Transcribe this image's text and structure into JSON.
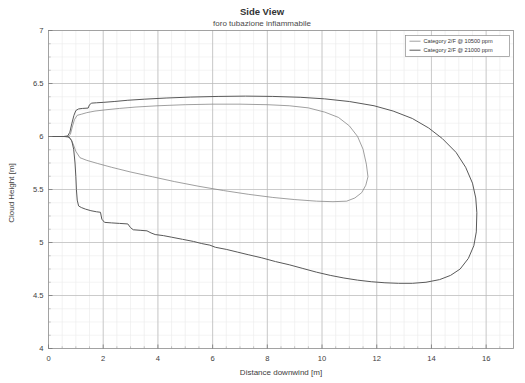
{
  "chart_data": {
    "type": "line",
    "title": "Side View",
    "subtitle": "foro tubazione infiammabile",
    "xlabel": "Distance downwind [m]",
    "ylabel": "Cloud Height [m]",
    "xlim": [
      0,
      17
    ],
    "ylim": [
      4,
      7
    ],
    "xticks": [
      0,
      2,
      4,
      6,
      8,
      10,
      12,
      14,
      16
    ],
    "xtick_labels": [
      "0",
      "2",
      "4",
      "6",
      "8",
      "10",
      "12",
      "14",
      "16"
    ],
    "yticks": [
      4,
      4.5,
      5,
      5.5,
      6,
      6.5,
      7
    ],
    "ytick_labels": [
      "4",
      "4.5",
      "5",
      "5.5",
      "6",
      "6.5",
      "7"
    ],
    "grid": true,
    "minor_grid": true,
    "legend_position": "top-right",
    "series": [
      {
        "name": "Category 2/F @ 10500 ppm",
        "color": "#808080",
        "closed_contour": true,
        "upper_points": [
          [
            0.0,
            6.0
          ],
          [
            0.25,
            6.0
          ],
          [
            0.5,
            6.0
          ],
          [
            0.72,
            6.0
          ],
          [
            0.8,
            6.02
          ],
          [
            0.88,
            6.1
          ],
          [
            0.95,
            6.16
          ],
          [
            1.05,
            6.2
          ],
          [
            1.2,
            6.21
          ],
          [
            1.4,
            6.225
          ],
          [
            1.7,
            6.24
          ],
          [
            2.1,
            6.252
          ],
          [
            2.6,
            6.265
          ],
          [
            3.2,
            6.278
          ],
          [
            4.0,
            6.29
          ],
          [
            5.0,
            6.3
          ],
          [
            6.0,
            6.305
          ],
          [
            7.0,
            6.305
          ],
          [
            8.0,
            6.3
          ],
          [
            8.8,
            6.29
          ],
          [
            9.5,
            6.27
          ],
          [
            10.1,
            6.23
          ],
          [
            10.6,
            6.18
          ],
          [
            11.0,
            6.1
          ],
          [
            11.3,
            6.0
          ],
          [
            11.5,
            5.88
          ],
          [
            11.62,
            5.74
          ],
          [
            11.68,
            5.62
          ]
        ],
        "lower_points": [
          [
            0.0,
            6.0
          ],
          [
            0.25,
            6.0
          ],
          [
            0.5,
            6.0
          ],
          [
            0.7,
            5.998
          ],
          [
            0.8,
            5.98
          ],
          [
            0.9,
            5.93
          ],
          [
            1.0,
            5.86
          ],
          [
            1.15,
            5.8
          ],
          [
            1.4,
            5.775
          ],
          [
            1.8,
            5.745
          ],
          [
            2.3,
            5.71
          ],
          [
            3.0,
            5.665
          ],
          [
            3.8,
            5.62
          ],
          [
            4.6,
            5.575
          ],
          [
            5.5,
            5.53
          ],
          [
            6.4,
            5.49
          ],
          [
            7.3,
            5.455
          ],
          [
            8.2,
            5.425
          ],
          [
            9.0,
            5.405
          ],
          [
            9.8,
            5.39
          ],
          [
            10.4,
            5.385
          ],
          [
            10.9,
            5.39
          ],
          [
            11.2,
            5.42
          ],
          [
            11.45,
            5.47
          ],
          [
            11.6,
            5.54
          ],
          [
            11.68,
            5.62
          ]
        ]
      },
      {
        "name": "Category 2/F @ 21000 ppm",
        "color": "#595959",
        "closed_contour": true,
        "upper_points": [
          [
            0.0,
            6.0
          ],
          [
            0.3,
            6.0
          ],
          [
            0.55,
            6.0
          ],
          [
            0.7,
            6.005
          ],
          [
            0.78,
            6.04
          ],
          [
            0.85,
            6.12
          ],
          [
            0.93,
            6.2
          ],
          [
            1.0,
            6.245
          ],
          [
            1.1,
            6.26
          ],
          [
            1.25,
            6.265
          ],
          [
            1.45,
            6.268
          ],
          [
            1.5,
            6.3
          ],
          [
            1.58,
            6.315
          ],
          [
            1.75,
            6.318
          ],
          [
            2.0,
            6.322
          ],
          [
            2.4,
            6.33
          ],
          [
            2.9,
            6.342
          ],
          [
            3.5,
            6.352
          ],
          [
            4.3,
            6.363
          ],
          [
            5.2,
            6.372
          ],
          [
            6.2,
            6.378
          ],
          [
            7.2,
            6.381
          ],
          [
            8.2,
            6.378
          ],
          [
            9.2,
            6.37
          ],
          [
            10.1,
            6.355
          ],
          [
            11.0,
            6.33
          ],
          [
            11.9,
            6.29
          ],
          [
            12.6,
            6.24
          ],
          [
            13.3,
            6.17
          ],
          [
            13.9,
            6.08
          ],
          [
            14.4,
            5.98
          ],
          [
            14.9,
            5.85
          ],
          [
            15.25,
            5.71
          ],
          [
            15.5,
            5.56
          ],
          [
            15.62,
            5.42
          ],
          [
            15.66,
            5.28
          ]
        ],
        "lower_points": [
          [
            0.0,
            6.0
          ],
          [
            0.3,
            6.0
          ],
          [
            0.6,
            6.0
          ],
          [
            0.75,
            5.995
          ],
          [
            0.85,
            5.96
          ],
          [
            0.92,
            5.88
          ],
          [
            0.97,
            5.75
          ],
          [
            1.0,
            5.62
          ],
          [
            1.02,
            5.5
          ],
          [
            1.05,
            5.4
          ],
          [
            1.1,
            5.345
          ],
          [
            1.2,
            5.33
          ],
          [
            1.35,
            5.315
          ],
          [
            1.55,
            5.3
          ],
          [
            1.75,
            5.29
          ],
          [
            1.9,
            5.285
          ],
          [
            1.95,
            5.22
          ],
          [
            2.05,
            5.19
          ],
          [
            2.3,
            5.185
          ],
          [
            2.6,
            5.18
          ],
          [
            2.9,
            5.175
          ],
          [
            3.0,
            5.14
          ],
          [
            3.1,
            5.12
          ],
          [
            3.35,
            5.115
          ],
          [
            3.6,
            5.11
          ],
          [
            3.75,
            5.09
          ],
          [
            3.9,
            5.075
          ],
          [
            4.2,
            5.065
          ],
          [
            4.5,
            5.05
          ],
          [
            4.9,
            5.03
          ],
          [
            5.3,
            5.01
          ],
          [
            5.6,
            4.99
          ],
          [
            5.9,
            4.975
          ],
          [
            6.1,
            4.955
          ],
          [
            6.5,
            4.935
          ],
          [
            6.9,
            4.91
          ],
          [
            7.3,
            4.885
          ],
          [
            7.8,
            4.855
          ],
          [
            8.3,
            4.82
          ],
          [
            8.8,
            4.79
          ],
          [
            9.3,
            4.755
          ],
          [
            9.8,
            4.72
          ],
          [
            10.3,
            4.69
          ],
          [
            10.8,
            4.665
          ],
          [
            11.3,
            4.645
          ],
          [
            11.8,
            4.63
          ],
          [
            12.3,
            4.62
          ],
          [
            12.8,
            4.615
          ],
          [
            13.3,
            4.615
          ],
          [
            13.8,
            4.625
          ],
          [
            14.3,
            4.65
          ],
          [
            14.7,
            4.69
          ],
          [
            15.05,
            4.75
          ],
          [
            15.35,
            4.85
          ],
          [
            15.55,
            4.97
          ],
          [
            15.64,
            5.1
          ],
          [
            15.66,
            5.28
          ]
        ]
      }
    ]
  },
  "legend": {
    "entries": [
      {
        "label": "Category 2/F @ 10500 ppm"
      },
      {
        "label": "Category 2/F @ 21000 ppm"
      }
    ]
  }
}
